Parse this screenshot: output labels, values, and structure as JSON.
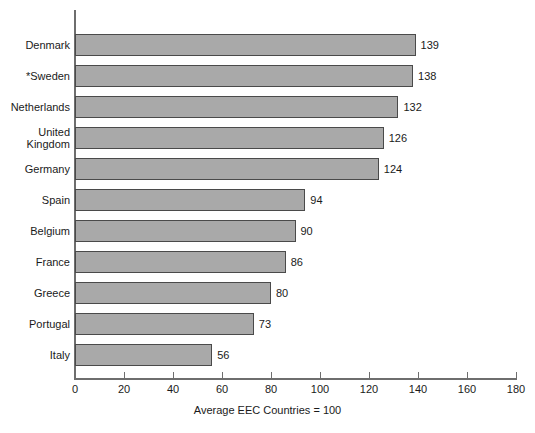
{
  "chart_data": {
    "type": "bar",
    "orientation": "horizontal",
    "title": "",
    "subtitle": "",
    "xlabel": "",
    "ylabel": "",
    "caption": "Average EEC Countries = 100",
    "categories": [
      "Denmark",
      "*Sweden",
      "Netherlands",
      "United\nKingdom",
      "Germany",
      "Spain",
      "Belgium",
      "France",
      "Greece",
      "Portugal",
      "Italy"
    ],
    "values": [
      139,
      138,
      132,
      126,
      124,
      94,
      90,
      86,
      80,
      73,
      56
    ],
    "value_labels": [
      "139",
      "138",
      "132",
      "126",
      "124",
      "94",
      "90",
      "86",
      "80",
      "73",
      "56"
    ],
    "xlim": [
      0,
      180
    ],
    "xticks": [
      0,
      20,
      40,
      60,
      80,
      100,
      120,
      140,
      160,
      180
    ],
    "xtick_labels": [
      "0",
      "20",
      "40",
      "60",
      "80",
      "100",
      "120",
      "140",
      "160",
      "180"
    ],
    "grid": false,
    "legend": null,
    "bar_fill_color": "#a9a9a9",
    "bar_border_color": "#4a4a4a",
    "axis_color": "#6e6e6e",
    "background_color": "#ffffff"
  }
}
